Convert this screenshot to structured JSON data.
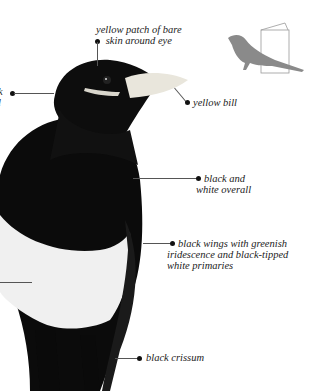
{
  "figure": {
    "annotations": [
      {
        "id": "eye-patch",
        "text_lines": [
          "yellow patch of bare",
          "skin around eye"
        ]
      },
      {
        "id": "bill",
        "text_lines": [
          "yellow bill"
        ]
      },
      {
        "id": "head-left",
        "text_lines": [
          "k",
          "l"
        ]
      },
      {
        "id": "overall",
        "text_lines": [
          "black and",
          "white overall"
        ]
      },
      {
        "id": "wings",
        "text_lines": [
          "black wings with greenish",
          "iridescence and black-tipped",
          "white primaries"
        ]
      },
      {
        "id": "crissum",
        "text_lines": [
          "black crissum"
        ]
      }
    ],
    "silhouette_icon": {
      "name": "bird-silhouette-book-icon",
      "color": "#8a8a8a"
    },
    "colors": {
      "background": "#ffffff",
      "bird_black": "#0a0a0a",
      "bird_white": "#f2f2f2",
      "bill": "#e9e6dc",
      "text": "#222222"
    }
  }
}
